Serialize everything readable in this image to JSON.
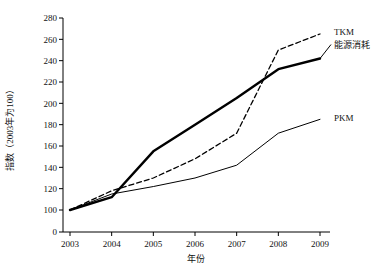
{
  "chart_data": {
    "type": "line",
    "title": "",
    "xlabel": "年份",
    "ylabel": "指数（2003年为100）",
    "x": [
      2003,
      2004,
      2005,
      2006,
      2007,
      2008,
      2009
    ],
    "categories": [
      "2003",
      "2004",
      "2005",
      "2006",
      "2007",
      "2008",
      "2009"
    ],
    "series": [
      {
        "name": "TKM",
        "label": "TKM",
        "style": "dashed",
        "width": 1.3,
        "color": "#000000",
        "values": [
          100,
          118,
          130,
          148,
          172,
          250,
          265
        ]
      },
      {
        "name": "能源消耗",
        "label": "能源消耗",
        "style": "solid",
        "width": 2.4,
        "color": "#000000",
        "values": [
          100,
          112,
          155,
          180,
          205,
          232,
          242
        ]
      },
      {
        "name": "PKM",
        "label": "PKM",
        "style": "solid",
        "width": 1,
        "color": "#000000",
        "values": [
          100,
          115,
          122,
          130,
          142,
          172,
          185
        ]
      }
    ],
    "ylim": [
      0,
      280
    ],
    "y_ticks": [
      0,
      100,
      120,
      140,
      160,
      180,
      200,
      220,
      240,
      260,
      280
    ],
    "y_tick_labels": [
      "0",
      "100",
      "120",
      "140",
      "160",
      "180",
      "200",
      "220",
      "240",
      "260",
      "280"
    ],
    "y_axis_broken": true,
    "y_break_between": [
      0,
      100
    ],
    "grid": false,
    "legend_position": "inline-right",
    "background": "#ffffff",
    "axis_color": "#000000"
  }
}
